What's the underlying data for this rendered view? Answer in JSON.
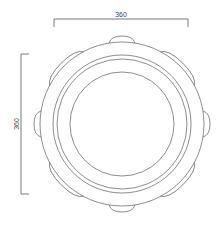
{
  "drawing": {
    "title": "Circular ring part with lugs - top view",
    "dimensions": {
      "width_label": "360",
      "height_label": "360"
    },
    "colors": {
      "line": "#6e6e6e",
      "dimension": "#555555",
      "background": "#ffffff"
    },
    "geometry": {
      "center": [
        122,
        124
      ],
      "lug_count": 8,
      "outer_body_radius": 82,
      "lug_outer_radius": 87,
      "ring_radii": [
        69,
        65
      ],
      "inner_radius": 52
    }
  }
}
